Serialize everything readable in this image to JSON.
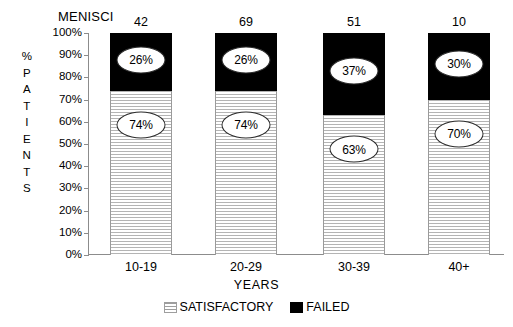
{
  "chart_data": {
    "type": "bar",
    "stacked": true,
    "title": "",
    "header_label": "MENISCI",
    "xlabel": "YEARS",
    "ylabel": "% PATIENTS",
    "ylabel_chars": [
      "%",
      "P",
      "A",
      "T",
      "I",
      "E",
      "N",
      "T",
      "S"
    ],
    "categories": [
      "10-19",
      "20-29",
      "30-39",
      "40+"
    ],
    "ylim": [
      0,
      100
    ],
    "ytick_labels": [
      "100%",
      "90%",
      "80%",
      "70%",
      "60%",
      "50%",
      "40%",
      "30%",
      "20%",
      "10%",
      "0%"
    ],
    "ytick_values": [
      100,
      90,
      80,
      70,
      60,
      50,
      40,
      30,
      20,
      10,
      0
    ],
    "grid": false,
    "legend_position": "bottom-center",
    "series": [
      {
        "name": "SATISFACTORY",
        "values": [
          74,
          74,
          63,
          70
        ],
        "labels": [
          "74%",
          "74%",
          "63%",
          "70%"
        ],
        "color": "#ffffff",
        "pattern": "horizontal-hatch"
      },
      {
        "name": "FAILED",
        "values": [
          26,
          26,
          37,
          30
        ],
        "labels": [
          "26%",
          "26%",
          "37%",
          "30%"
        ],
        "color": "#000000",
        "pattern": "solid"
      }
    ],
    "bar_counts": [
      "42",
      "69",
      "51",
      "10"
    ],
    "bar_count_values": [
      42,
      69,
      51,
      10
    ]
  },
  "legend": {
    "items": [
      {
        "label": "SATISFACTORY",
        "swatch": "hatch-swatch-icon"
      },
      {
        "label": "FAILED",
        "swatch": "black-swatch-icon"
      }
    ]
  }
}
